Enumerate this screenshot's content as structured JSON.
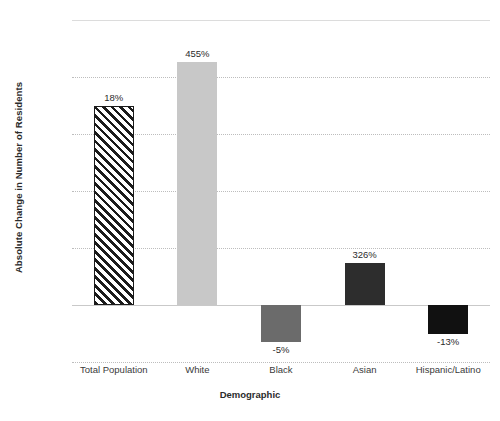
{
  "chart_data": {
    "type": "bar",
    "title": "",
    "xlabel": "Demographic",
    "ylabel": "Absolute Change in Number of Residents",
    "categories": [
      "Total Population",
      "White",
      "Black",
      "Asian",
      "Hispanic/Latino"
    ],
    "values": [
      3500,
      4270,
      -645,
      740,
      -500
    ],
    "data_labels": [
      "18%",
      "455%",
      "-5%",
      "326%",
      "-13%"
    ],
    "ylim": [
      -1000,
      5000
    ],
    "yticks": [
      5000,
      4000,
      3000,
      2000,
      1000,
      0,
      -1000
    ],
    "ytick_labels": [
      "5,000",
      "4,000",
      "3,000",
      "2,000",
      "1,000",
      "0",
      "-1,000"
    ],
    "grid": true,
    "legend": "none",
    "bar_styles": [
      {
        "name": "Total Population",
        "fill": "#ffffff",
        "pattern": "diagonal-hatch",
        "stroke": "#1b1b1b"
      },
      {
        "name": "White",
        "fill": "#c8c8c8",
        "pattern": "solid",
        "stroke": "none"
      },
      {
        "name": "Black",
        "fill": "#6b6b6b",
        "pattern": "solid",
        "stroke": "none"
      },
      {
        "name": "Asian",
        "fill": "#2d2d2d",
        "pattern": "solid",
        "stroke": "none"
      },
      {
        "name": "Hispanic/Latino",
        "fill": "#111111",
        "pattern": "solid",
        "stroke": "none"
      }
    ],
    "colors": {
      "background": "#ffffff",
      "gridline": "#bdbdbd",
      "axis_text": "#3a3a3a",
      "title_text": "#2b2b2b"
    }
  }
}
